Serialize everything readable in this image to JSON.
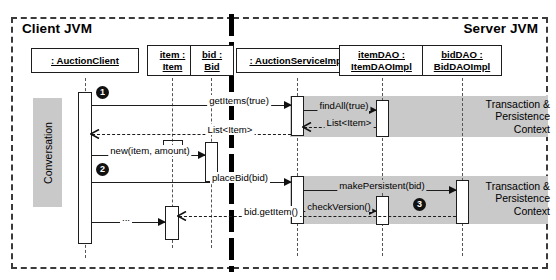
{
  "diagram": {
    "partitions": [
      {
        "name": "client-jvm",
        "label": "Client JVM"
      },
      {
        "name": "server-jvm",
        "label": "Server JVM"
      }
    ],
    "bands": {
      "conversation": "Conversation",
      "transaction_context_1": "Transaction & Persistence Context",
      "transaction_context_2": "Transaction & Persistence Context"
    },
    "lifelines": [
      {
        "name": "auction-client",
        "line1": ": AuctionClient",
        "line2": ""
      },
      {
        "name": "item",
        "line1": "item :",
        "line2": "Item"
      },
      {
        "name": "bid",
        "line1": "bid :",
        "line2": "Bid"
      },
      {
        "name": "auction-service-impl",
        "line1": ": AuctionServiceImpl",
        "line2": ""
      },
      {
        "name": "item-dao",
        "line1": "itemDAO :",
        "line2": "ItemDAOImpl"
      },
      {
        "name": "bid-dao",
        "line1": "bidDAO :",
        "line2": "BidDAOImpl"
      }
    ],
    "messages": [
      {
        "name": "get-items",
        "label": "getItems(true)"
      },
      {
        "name": "find-all",
        "label": "findAll(true)"
      },
      {
        "name": "return-list-dao",
        "label": "List<Item>"
      },
      {
        "name": "return-list",
        "label": "List<Item>"
      },
      {
        "name": "new-bid",
        "label": "new(item, amount)"
      },
      {
        "name": "place-bid",
        "label": "placeBid(bid)"
      },
      {
        "name": "make-persistent",
        "label": "makePersistent(bid)"
      },
      {
        "name": "check-version",
        "label": "checkVersion()"
      },
      {
        "name": "bid-get-item",
        "label": "bid.getItem()"
      },
      {
        "name": "ellipsis",
        "label": "..."
      }
    ],
    "step_markers": [
      {
        "name": "step-1",
        "label": "1"
      },
      {
        "name": "step-2",
        "label": "2"
      },
      {
        "name": "step-3",
        "label": "3"
      }
    ],
    "colors": {
      "band_gray": "#c9c9c9",
      "line_black": "#1d1d1d",
      "background": "#ffffff"
    }
  }
}
